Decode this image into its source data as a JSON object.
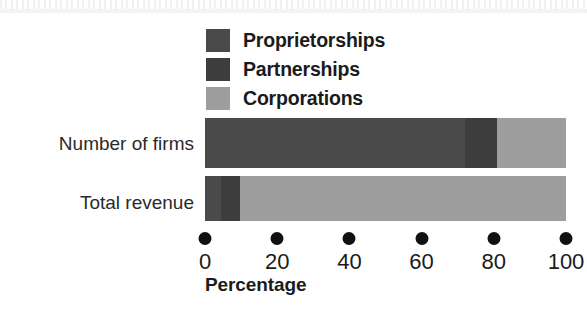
{
  "chart_data": {
    "type": "bar",
    "orientation": "horizontal",
    "stacked": true,
    "title": "",
    "subtitle": "",
    "xlabel": "Percentage",
    "ylabel": "",
    "categories": [
      "Number of firms",
      "Total revenue"
    ],
    "series": [
      {
        "name": "Proprietorships",
        "color": "#4a4a4a",
        "values": [
          72.0,
          4.5
        ]
      },
      {
        "name": "Partnerships",
        "color": "#3d3d3d",
        "values": [
          9.0,
          5.2
        ]
      },
      {
        "name": "Corporations",
        "color": "#9e9e9e",
        "values": [
          19.0,
          90.3
        ]
      }
    ],
    "xlim": [
      0,
      100
    ],
    "xticks": [
      0,
      20,
      40,
      60,
      80,
      100
    ],
    "xticklabels": [
      "0",
      "20",
      "40",
      "60",
      "80",
      "100"
    ],
    "grid": false,
    "legend_position": "top-center",
    "tick_marker": "filled-dot"
  },
  "legend": {
    "items": [
      {
        "label": "Proprietorships",
        "swatch_name": "legend-swatch-proprietorships",
        "color": "#4a4a4a"
      },
      {
        "label": "Partnerships",
        "swatch_name": "legend-swatch-partnerships",
        "color": "#3d3d3d"
      },
      {
        "label": "Corporations",
        "swatch_name": "legend-swatch-corporations",
        "color": "#9e9e9e"
      }
    ]
  },
  "axis": {
    "title": "Percentage",
    "ticks": [
      {
        "value": 0,
        "label": "0"
      },
      {
        "value": 20,
        "label": "20"
      },
      {
        "value": 40,
        "label": "40"
      },
      {
        "value": 60,
        "label": "60"
      },
      {
        "value": 80,
        "label": "80"
      },
      {
        "value": 100,
        "label": "100"
      }
    ]
  },
  "categories": {
    "firms": "Number of firms",
    "revenue": "Total revenue"
  }
}
